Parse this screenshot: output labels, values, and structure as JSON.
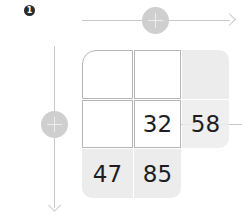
{
  "step_badge": "1",
  "axes": {
    "horizontal": {
      "icon": "plus-circle-icon",
      "direction": "right"
    },
    "vertical": {
      "icon": "plus-circle-icon",
      "direction": "down"
    }
  },
  "grid": {
    "rows": [
      [
        "",
        "",
        ""
      ],
      [
        "",
        "32",
        "58"
      ],
      [
        "47",
        "85",
        ""
      ]
    ],
    "cells": {
      "r1c2": "32",
      "r1c3": "58",
      "r2c1": "47",
      "r2c2": "85"
    }
  },
  "colors": {
    "line": "#c9c9c9",
    "circle": "#cfcfcf",
    "cell_border": "#b5b5b5",
    "shaded_cell": "#ececec",
    "text": "#1e1e1e"
  }
}
